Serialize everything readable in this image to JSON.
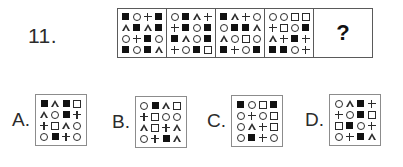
{
  "question": {
    "number_label": "11.",
    "answer_placeholder": "?"
  },
  "symbol_legend": {
    "filled-square": "filled-square",
    "open-square": "open-square",
    "circle": "circle",
    "triangle": "triangle",
    "plus": "plus"
  },
  "sequence": {
    "panels": [
      {
        "name": "sequence-panel-1",
        "rows": [
          [
            "filled-square",
            "circle",
            "plus",
            "filled-square"
          ],
          [
            "triangle",
            "filled-square",
            "triangle",
            "filled-square"
          ],
          [
            "circle",
            "plus",
            "filled-square",
            "circle"
          ],
          [
            "filled-square",
            "circle",
            "filled-square",
            "triangle"
          ]
        ]
      },
      {
        "name": "sequence-panel-2",
        "rows": [
          [
            "circle",
            "filled-square",
            "triangle",
            "plus"
          ],
          [
            "plus",
            "filled-square",
            "circle",
            "filled-square"
          ],
          [
            "filled-square",
            "triangle",
            "circle",
            "filled-square"
          ],
          [
            "plus",
            "circle",
            "filled-square",
            "open-square"
          ]
        ]
      },
      {
        "name": "sequence-panel-3",
        "rows": [
          [
            "filled-square",
            "triangle",
            "plus",
            "circle"
          ],
          [
            "circle",
            "filled-square",
            "filled-square",
            "triangle"
          ],
          [
            "triangle",
            "circle",
            "open-square",
            "circle"
          ],
          [
            "filled-square",
            "plus",
            "circle",
            "filled-square"
          ]
        ]
      },
      {
        "name": "sequence-panel-4",
        "rows": [
          [
            "circle",
            "circle",
            "open-square",
            "open-square"
          ],
          [
            "plus",
            "open-square",
            "circle",
            "filled-square"
          ],
          [
            "triangle",
            "plus",
            "filled-square",
            "plus"
          ],
          [
            "filled-square",
            "filled-square",
            "circle",
            "plus"
          ]
        ]
      }
    ]
  },
  "options": [
    {
      "label": "A.",
      "name": "option-a",
      "rows": [
        [
          "filled-square",
          "triangle",
          "filled-square",
          "open-square"
        ],
        [
          "triangle",
          "circle",
          "filled-square",
          "plus"
        ],
        [
          "plus",
          "open-square",
          "triangle",
          "circle"
        ],
        [
          "circle",
          "filled-square",
          "plus",
          "circle"
        ]
      ]
    },
    {
      "label": "B.",
      "name": "option-b",
      "rows": [
        [
          "circle",
          "filled-square",
          "triangle",
          "open-square"
        ],
        [
          "plus",
          "open-square",
          "circle",
          "circle"
        ],
        [
          "triangle",
          "open-square",
          "plus",
          "triangle"
        ],
        [
          "circle",
          "plus",
          "filled-square",
          "triangle"
        ]
      ]
    },
    {
      "label": "C.",
      "name": "option-c",
      "rows": [
        [
          "filled-square",
          "circle",
          "open-square",
          "filled-square"
        ],
        [
          "circle",
          "plus",
          "circle",
          "open-square"
        ],
        [
          "circle",
          "triangle",
          "plus",
          "open-square"
        ],
        [
          "circle",
          "filled-square",
          "plus",
          "circle"
        ]
      ]
    },
    {
      "label": "D.",
      "name": "option-d",
      "rows": [
        [
          "circle",
          "triangle",
          "filled-square",
          "plus"
        ],
        [
          "plus",
          "circle",
          "filled-square",
          "open-square"
        ],
        [
          "open-square",
          "filled-square",
          "circle",
          "plus"
        ],
        [
          "circle",
          "plus",
          "filled-square",
          "triangle"
        ]
      ]
    }
  ],
  "colors": {
    "ink": "#111111",
    "outline": "#2b2b2b",
    "border": "#5a5a5a",
    "option_border": "#8c8c8c",
    "background": "#ffffff"
  }
}
